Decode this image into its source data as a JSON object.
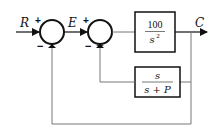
{
  "diagram": {
    "type": "block-diagram",
    "signals": {
      "input": "R",
      "error": "E",
      "output": "C"
    },
    "summing_junctions": [
      {
        "id": "sum1",
        "plus_sign": "+",
        "minus_sign": "−"
      },
      {
        "id": "sum2",
        "plus_sign": "+",
        "minus_sign": "−"
      }
    ],
    "blocks": {
      "forward": {
        "numerator": "100",
        "denominator_base": "s",
        "denominator_exp": "2"
      },
      "feedback": {
        "numerator": "s",
        "denominator": "s + P"
      }
    },
    "colors": {
      "lines": "#111111",
      "loop_lines": "#777777",
      "background": "#ffffff"
    }
  }
}
